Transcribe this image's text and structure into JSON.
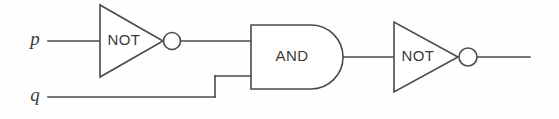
{
  "diagram": {
    "kind": "logic-circuit",
    "background_color": "#fefefe",
    "line_color": "#4a4a4a",
    "text_color": "#3a3a3a",
    "inputs": [
      {
        "id": "p",
        "label": "p",
        "x": 35,
        "y": 41
      },
      {
        "id": "q",
        "label": "q",
        "x": 35,
        "y": 97
      }
    ],
    "gates": [
      {
        "id": "not-1",
        "type": "NOT",
        "label": "NOT",
        "label_x": 124,
        "label_y": 41,
        "triangle": {
          "x1": 100,
          "y1": 5,
          "x2": 100,
          "y2": 77,
          "apex_x": 163,
          "apex_y": 41
        },
        "bubble": {
          "cx": 172,
          "cy": 41,
          "r": 8.5
        }
      },
      {
        "id": "and-1",
        "type": "AND",
        "label": "AND",
        "label_x": 292,
        "label_y": 57,
        "body": {
          "left": 251,
          "top": 25,
          "bottom": 89,
          "right": 343
        }
      },
      {
        "id": "not-2",
        "type": "NOT",
        "label": "NOT",
        "label_x": 418,
        "label_y": 57,
        "triangle": {
          "x1": 394,
          "y1": 22,
          "x2": 394,
          "y2": 92,
          "apex_x": 458,
          "apex_y": 57
        },
        "bubble": {
          "cx": 468,
          "cy": 57,
          "r": 9
        }
      }
    ],
    "wires": [
      {
        "id": "wire-p-to-not1",
        "d": "M 48 41 L 100 41"
      },
      {
        "id": "wire-not1-to-and-top",
        "d": "M 181 41 L 251 41"
      },
      {
        "id": "wire-q-to-jog",
        "d": "M 48 97 L 215 97"
      },
      {
        "id": "wire-jog-vertical",
        "d": "M 215 97 L 215 76"
      },
      {
        "id": "wire-jog-to-and-bottom",
        "d": "M 215 76 L 251 76"
      },
      {
        "id": "wire-and-to-not2",
        "d": "M 343 57 L 394 57"
      },
      {
        "id": "wire-not2-output",
        "d": "M 477 57 L 530 57"
      }
    ]
  }
}
